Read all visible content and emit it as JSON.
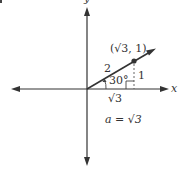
{
  "figure": {
    "stroke_color": "#333333",
    "background": "#ffffff",
    "axes": {
      "x_label": "x",
      "y_label": "y"
    },
    "point": {
      "label": "(√3, 1)",
      "x": "√3",
      "y": "1"
    },
    "triangle": {
      "hypotenuse_label": "2",
      "opposite_label": "1",
      "adjacent_label": "√3",
      "angle_label": "30°"
    },
    "equation": "a = √3",
    "corner_mark": "·"
  }
}
